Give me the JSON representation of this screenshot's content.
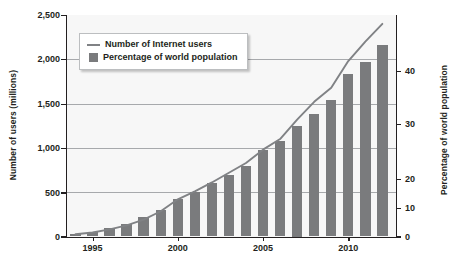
{
  "chart_data": {
    "type": "bar",
    "title": "",
    "subtitle": "",
    "xlabel": "",
    "ylabel": "Number of users (millions)",
    "ylabel_right": "Percentage of world population",
    "grid": true,
    "legend_position": "top-left-inside",
    "x": [
      1994,
      1995,
      1996,
      1997,
      1998,
      1999,
      2000,
      2001,
      2002,
      2003,
      2004,
      2005,
      2006,
      2007,
      2008,
      2009,
      2010,
      2011,
      2012
    ],
    "xlim": [
      1993.5,
      2012.8
    ],
    "xticks": [
      1995,
      2000,
      2005,
      2010
    ],
    "xticklabels": [
      "1995",
      "2000",
      "2005",
      "2010"
    ],
    "ylim": [
      0,
      2500
    ],
    "yticks": [
      0,
      500,
      1000,
      1500,
      2000,
      2500
    ],
    "yticklabels": [
      "0",
      "500",
      "1,000",
      "1,500",
      "2,000",
      "2,500"
    ],
    "ylim_right": [
      0,
      40
    ],
    "yticks_right": [
      0,
      10,
      20,
      30,
      40
    ],
    "yticklabels_right": [
      "0",
      "10",
      "20",
      "30",
      "40"
    ],
    "series": [
      {
        "name": "Number of Internet users",
        "type": "line",
        "axis": "left",
        "unit": "millions",
        "color": "#808285",
        "values": [
          25,
          45,
          80,
          125,
          190,
          285,
          420,
          510,
          610,
          720,
          830,
          980,
          1100,
          1320,
          1520,
          1680,
          1980,
          2200,
          2400
        ]
      },
      {
        "name": "Percentage of world population",
        "type": "bar",
        "axis": "right",
        "unit": "%",
        "color": "#7a7b7d",
        "values": [
          0.4,
          0.8,
          1.5,
          2.2,
          3.5,
          4.8,
          6.7,
          8.1,
          9.6,
          11.1,
          12.7,
          15.7,
          17.3,
          20.0,
          22.2,
          24.7,
          29.4,
          31.6,
          34.6
        ]
      }
    ]
  },
  "legend": {
    "items": [
      {
        "label": "Number of Internet users",
        "marker": "line-swatch"
      },
      {
        "label": "Percentage of world population",
        "marker": "box-swatch"
      }
    ]
  },
  "axes": {
    "left": {
      "title": "Number of users (millions)",
      "ticks": [
        "2,500",
        "2,000",
        "1,500",
        "1,000",
        "500",
        "0"
      ]
    },
    "right": {
      "title": "Percentage of world population",
      "ticks": [
        "40",
        "30",
        "20",
        "10",
        "0"
      ]
    },
    "bottom": {
      "ticks": [
        "1995",
        "2000",
        "2005",
        "2010"
      ]
    }
  },
  "colors": {
    "bar": "#7a7b7d",
    "line": "#808285",
    "grid": "#a7a9ac",
    "axis": "#231f20",
    "plot_background": "#f7f7f7"
  }
}
